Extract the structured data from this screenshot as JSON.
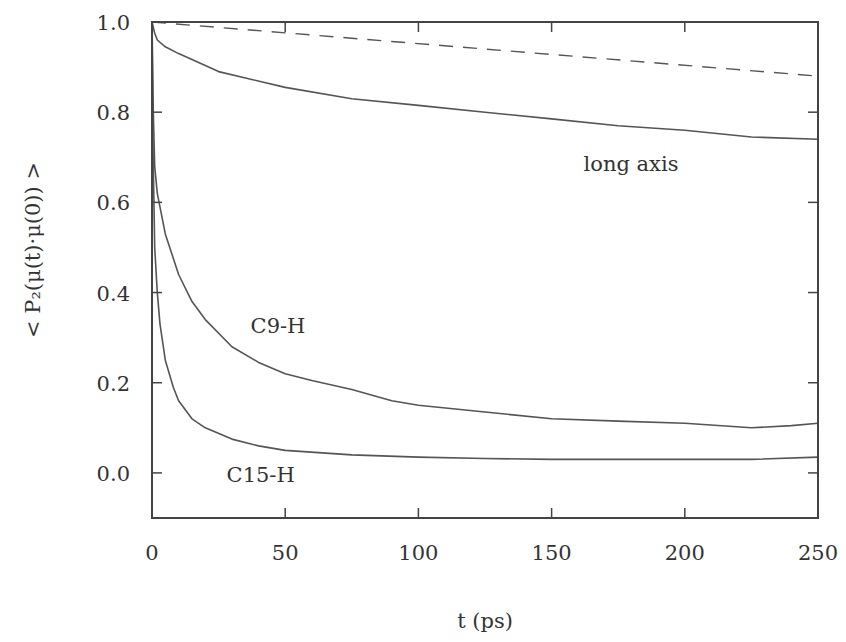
{
  "chart_data": {
    "type": "line",
    "title": "",
    "xlabel": "t (ps)",
    "ylabel": "< P₂(μ(t)·μ(0)) >",
    "xlim": [
      0,
      250
    ],
    "ylim": [
      -0.1,
      1.0
    ],
    "xticks": [
      0,
      50,
      100,
      150,
      200,
      250
    ],
    "xtick_labels": [
      "0",
      "50",
      "100",
      "150",
      "200",
      "250"
    ],
    "yticks": [
      0.0,
      0.2,
      0.4,
      0.6,
      0.8,
      1.0
    ],
    "ytick_labels": [
      "0.0",
      "0.2",
      "0.4",
      "0.6",
      "0.8",
      "1.0"
    ],
    "grid": false,
    "series": [
      {
        "name": "reference (dashed)",
        "style": "dashed",
        "x": [
          0,
          250
        ],
        "y": [
          1.0,
          0.88
        ]
      },
      {
        "name": "long axis",
        "style": "solid",
        "x": [
          0,
          1,
          2,
          5,
          10,
          25,
          50,
          75,
          100,
          125,
          150,
          175,
          200,
          225,
          250
        ],
        "y": [
          1.0,
          0.975,
          0.96,
          0.945,
          0.93,
          0.89,
          0.855,
          0.83,
          0.815,
          0.8,
          0.785,
          0.77,
          0.76,
          0.745,
          0.74
        ]
      },
      {
        "name": "C9-H",
        "style": "solid",
        "x": [
          0,
          0.5,
          1,
          2,
          5,
          10,
          15,
          20,
          30,
          40,
          50,
          60,
          75,
          90,
          100,
          125,
          150,
          175,
          200,
          225,
          240,
          250
        ],
        "y": [
          1.0,
          0.8,
          0.68,
          0.62,
          0.53,
          0.44,
          0.38,
          0.34,
          0.28,
          0.245,
          0.22,
          0.205,
          0.185,
          0.16,
          0.15,
          0.135,
          0.12,
          0.115,
          0.11,
          0.1,
          0.105,
          0.11
        ]
      },
      {
        "name": "C15-H",
        "style": "solid",
        "x": [
          0,
          0.3,
          1,
          2,
          3,
          5,
          8,
          10,
          15,
          20,
          30,
          40,
          50,
          75,
          100,
          125,
          150,
          175,
          200,
          225,
          250
        ],
        "y": [
          1.0,
          0.75,
          0.5,
          0.4,
          0.33,
          0.25,
          0.19,
          0.16,
          0.12,
          0.1,
          0.075,
          0.06,
          0.05,
          0.04,
          0.035,
          0.032,
          0.03,
          0.03,
          0.03,
          0.03,
          0.035
        ]
      }
    ],
    "annotations": [
      {
        "text": "long axis",
        "x": 162,
        "y": 0.67
      },
      {
        "text": "C9-H",
        "x": 37,
        "y": 0.31
      },
      {
        "text": "C15-H",
        "x": 28,
        "y": -0.02
      }
    ]
  }
}
